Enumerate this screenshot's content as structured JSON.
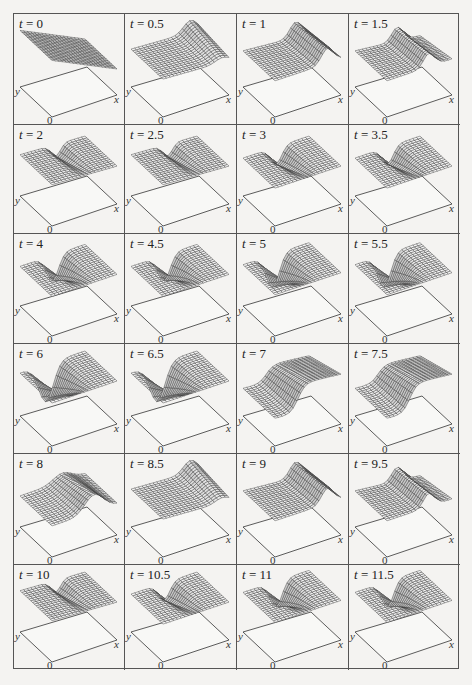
{
  "figure": {
    "title": "",
    "rows": 6,
    "cols": 4,
    "time_variable": "t",
    "axes": {
      "x_label": "x",
      "y_label": "y",
      "origin_label": "0"
    },
    "colors": {
      "line": "#333333",
      "border": "#555555",
      "background": "#f4f3f1"
    }
  },
  "panels": [
    {
      "label": "t = 0",
      "t": 0,
      "surface": "flat-tilted"
    },
    {
      "label": "t = 0.5",
      "t": 0.5,
      "surface": "ridge-rising-right"
    },
    {
      "label": "t = 1",
      "t": 1,
      "surface": "ridge-right-high"
    },
    {
      "label": "t = 1.5",
      "t": 1.5,
      "surface": "ridge-right-fold"
    },
    {
      "label": "t = 2",
      "t": 2,
      "surface": "fold-center"
    },
    {
      "label": "t = 2.5",
      "t": 2.5,
      "surface": "fold-center"
    },
    {
      "label": "t = 3",
      "t": 3,
      "surface": "fold-dip"
    },
    {
      "label": "t = 3.5",
      "t": 3.5,
      "surface": "fold-dip"
    },
    {
      "label": "t = 4",
      "t": 4,
      "surface": "dip-deep"
    },
    {
      "label": "t = 4.5",
      "t": 4.5,
      "surface": "dip-deep"
    },
    {
      "label": "t = 5",
      "t": 5,
      "surface": "dip-deeper"
    },
    {
      "label": "t = 5.5",
      "t": 5.5,
      "surface": "dip-deeper"
    },
    {
      "label": "t = 6",
      "t": 6,
      "surface": "well"
    },
    {
      "label": "t = 6.5",
      "t": 6.5,
      "surface": "well"
    },
    {
      "label": "t = 7",
      "t": 7,
      "surface": "wall-up"
    },
    {
      "label": "t = 7.5",
      "t": 7.5,
      "surface": "wall-up"
    },
    {
      "label": "t = 8",
      "t": 8,
      "surface": "wave-s"
    },
    {
      "label": "t = 8.5",
      "t": 8.5,
      "surface": "ridge-rising-right"
    },
    {
      "label": "t = 9",
      "t": 9,
      "surface": "ridge-right-high"
    },
    {
      "label": "t = 9.5",
      "t": 9.5,
      "surface": "ridge-right-fold"
    },
    {
      "label": "t = 10",
      "t": 10,
      "surface": "fold-center"
    },
    {
      "label": "t = 10.5",
      "t": 10.5,
      "surface": "fold-dip"
    },
    {
      "label": "t = 11",
      "t": 11,
      "surface": "dip-deep"
    },
    {
      "label": "t = 11.5",
      "t": 11.5,
      "surface": "dip-deep"
    }
  ]
}
